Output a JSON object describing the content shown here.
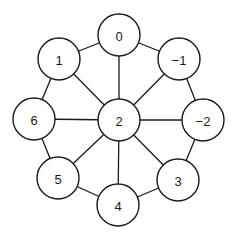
{
  "diagram": {
    "type": "wheel-graph",
    "colors": {
      "stroke": "#1a1a1a",
      "fill": "#ffffff",
      "background": "#ffffff"
    },
    "node_radius": 21,
    "nodes": [
      {
        "id": "n0",
        "label": "0",
        "x": 119,
        "y": 35
      },
      {
        "id": "nm1",
        "label": "−1",
        "x": 179,
        "y": 59
      },
      {
        "id": "nm2",
        "label": "−2",
        "x": 203,
        "y": 120
      },
      {
        "id": "n3",
        "label": "3",
        "x": 178,
        "y": 180
      },
      {
        "id": "n4",
        "label": "4",
        "x": 118,
        "y": 205
      },
      {
        "id": "n5",
        "label": "5",
        "x": 58,
        "y": 178
      },
      {
        "id": "n6",
        "label": "6",
        "x": 34,
        "y": 119
      },
      {
        "id": "n1",
        "label": "1",
        "x": 59,
        "y": 59
      },
      {
        "id": "n2",
        "label": "2",
        "x": 119,
        "y": 120
      }
    ],
    "edges": [
      [
        "n0",
        "nm1"
      ],
      [
        "nm1",
        "nm2"
      ],
      [
        "nm2",
        "n3"
      ],
      [
        "n3",
        "n4"
      ],
      [
        "n4",
        "n5"
      ],
      [
        "n5",
        "n6"
      ],
      [
        "n6",
        "n1"
      ],
      [
        "n1",
        "n0"
      ],
      [
        "n2",
        "n0"
      ],
      [
        "n2",
        "nm1"
      ],
      [
        "n2",
        "nm2"
      ],
      [
        "n2",
        "n3"
      ],
      [
        "n2",
        "n4"
      ],
      [
        "n2",
        "n5"
      ],
      [
        "n2",
        "n6"
      ],
      [
        "n2",
        "n1"
      ]
    ]
  }
}
